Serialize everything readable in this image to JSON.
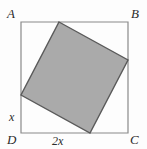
{
  "figure": {
    "width": 147,
    "height": 149,
    "background_color": "#fdfdfd"
  },
  "colors": {
    "outer_stroke": "#8a8a8a",
    "inner_fill": "#aaaaaa",
    "inner_stroke": "#5a5a5a",
    "label_text": "#2b2b2b"
  },
  "outer_square": {
    "name": "ABCD",
    "stroke_width": 1.2,
    "points": "21,22 128,22 128,133 21,133",
    "vertices": {
      "A": {
        "label": "A",
        "x": 21,
        "y": 22
      },
      "B": {
        "label": "B",
        "x": 128,
        "y": 22
      },
      "C": {
        "label": "C",
        "x": 128,
        "y": 133
      },
      "D": {
        "label": "D",
        "x": 21,
        "y": 133
      }
    }
  },
  "inner_square": {
    "name": "shaded-inscribed-square",
    "stroke_width": 1.4,
    "points": "59,22 128,60 90,133 21,95",
    "vertices": [
      {
        "name": "top-vertex-on-AB",
        "x": 59,
        "y": 22
      },
      {
        "name": "right-vertex-on-BC",
        "x": 128,
        "y": 60
      },
      {
        "name": "bottom-vertex-on-DC",
        "x": 90,
        "y": 133
      },
      {
        "name": "left-vertex-on-AD",
        "x": 21,
        "y": 95
      }
    ]
  },
  "labels": {
    "A": "A",
    "B": "B",
    "C": "C",
    "D": "D",
    "left_segment": "x",
    "bottom_segment": "2x"
  }
}
